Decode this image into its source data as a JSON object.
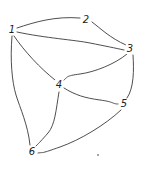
{
  "diagram": {
    "type": "undirected-graph",
    "style": "hand-drawn",
    "nodes": [
      {
        "id": "1",
        "label": "1",
        "x": 12,
        "y": 30
      },
      {
        "id": "2",
        "label": "2",
        "x": 86,
        "y": 20
      },
      {
        "id": "3",
        "label": "3",
        "x": 130,
        "y": 49
      },
      {
        "id": "4",
        "label": "4",
        "x": 59,
        "y": 85
      },
      {
        "id": "5",
        "label": "5",
        "x": 124,
        "y": 104
      },
      {
        "id": "6",
        "label": "6",
        "x": 32,
        "y": 152
      }
    ],
    "edges": [
      {
        "from": "1",
        "to": "2"
      },
      {
        "from": "1",
        "to": "3"
      },
      {
        "from": "2",
        "to": "3"
      },
      {
        "from": "1",
        "to": "4"
      },
      {
        "from": "1",
        "to": "6"
      },
      {
        "from": "3",
        "to": "4"
      },
      {
        "from": "3",
        "to": "5"
      },
      {
        "from": "4",
        "to": "5"
      },
      {
        "from": "4",
        "to": "6"
      },
      {
        "from": "5",
        "to": "6"
      }
    ],
    "stray_mark": {
      "x": 98,
      "y": 155
    },
    "colors": {
      "line": "#3a3a3a",
      "text": "#222222",
      "background": "#ffffff"
    }
  }
}
